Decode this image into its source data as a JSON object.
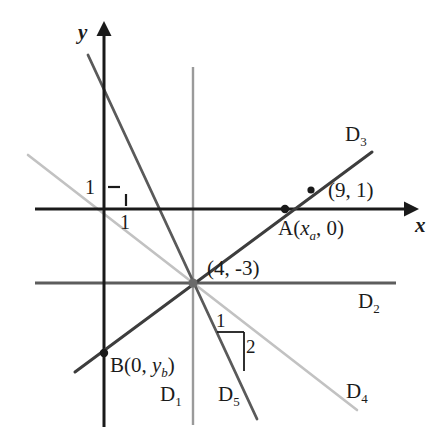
{
  "figure": {
    "type": "coordinate-plane-diagram",
    "canvas": {
      "width": 443,
      "height": 436
    },
    "background": "#ffffff",
    "origin": {
      "x": 104,
      "y": 209
    },
    "unit_px": 22,
    "axes": {
      "x_label": "x",
      "y_label": "y",
      "x_tick_label": "1",
      "y_tick_label": "1",
      "color": "#1a1a1a"
    },
    "colors": {
      "axis": "#1a1a1a",
      "dark_line": "#3d3d3d",
      "mid_gray": "#6e6e6e",
      "light_gray": "#b9b9b9",
      "text": "#1b1b1b"
    },
    "lines": [
      {
        "name": "D1",
        "label": "D",
        "sub": "1",
        "kind": "vertical",
        "equation": "x = 4",
        "color": "#9a9a9a",
        "width": 2.2
      },
      {
        "name": "D2",
        "label": "D",
        "sub": "2",
        "kind": "horizontal",
        "equation": "y = -3",
        "color": "#5d5d5d",
        "width": 2.6
      },
      {
        "name": "D3",
        "label": "D",
        "sub": "3",
        "kind": "oblique",
        "equation": "slope +1/1.25",
        "color": "#3d3d3d",
        "width": 3.0
      },
      {
        "name": "D4",
        "label": "D",
        "sub": "4",
        "kind": "oblique",
        "equation": "slope -3/4",
        "color": "#c2c2c2",
        "width": 2.6
      },
      {
        "name": "D5",
        "label": "D",
        "sub": "5",
        "kind": "oblique",
        "equation": "slope -2/1",
        "color": "#5a5a5a",
        "width": 2.8
      }
    ],
    "points": [
      {
        "name": "A",
        "label": "A(",
        "var": "x",
        "varsub": "a",
        "label_tail": ", 0)",
        "x": 285,
        "y": 209
      },
      {
        "name": "P9",
        "label": "(9, 1)",
        "x": 311,
        "y": 190
      },
      {
        "name": "B",
        "label": "B(0, ",
        "var": "y",
        "varsub": "b",
        "label_tail": ")",
        "x": 104,
        "y": 353
      },
      {
        "name": "M",
        "label": "(4, -3)",
        "x": 193,
        "y": 283
      }
    ],
    "slope_triangle": {
      "run_label": "1",
      "rise_label": "2"
    }
  }
}
